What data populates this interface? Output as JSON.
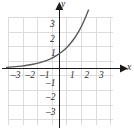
{
  "chart_data": {
    "type": "line",
    "title": "",
    "subtitle": "",
    "xlabel": "x",
    "ylabel": "y",
    "xlim": [
      -3.6,
      3.75
    ],
    "ylim": [
      -3.6,
      3.75
    ],
    "grid": true,
    "grid_step": 1,
    "grid_color": "#d8d8d8",
    "axis_color": "#1a1a1a",
    "curve_color": "#595959",
    "legend": "none",
    "annotations": [],
    "x_ticks": [
      -3,
      -2,
      -1,
      1,
      2,
      3
    ],
    "x_tick_labels": [
      "–3",
      "–2",
      "–1",
      "1",
      "2",
      "3"
    ],
    "y_ticks": [
      -3,
      -2,
      -1,
      1,
      2,
      3
    ],
    "y_tick_labels": [
      "–3",
      "–2",
      "–1",
      "1",
      "2",
      "3"
    ],
    "series": [
      {
        "name": "exponential curve",
        "description": "increasing exponential function passing through (0, 1)",
        "x": [
          -3.6,
          -3.2,
          -2.8,
          -2.4,
          -2.0,
          -1.6,
          -1.2,
          -0.8,
          -0.4,
          0.0,
          0.4,
          0.8,
          1.2,
          1.6,
          2.0,
          2.4,
          2.8,
          3.2,
          3.5
        ],
        "y": [
          0.08,
          0.11,
          0.14,
          0.19,
          0.25,
          0.33,
          0.44,
          0.57,
          0.76,
          1.0,
          1.32,
          1.74,
          2.3,
          3.03,
          4.0,
          5.28,
          6.96,
          9.19,
          11.31
        ]
      }
    ]
  },
  "axis_labels": {
    "x": "x",
    "y": "y"
  },
  "x_tick_text": {
    "neg3": "–3",
    "neg2": "–2",
    "neg1": "–1",
    "pos1": "1",
    "pos2": "2",
    "pos3": "3"
  },
  "y_tick_text": {
    "pos3": "3",
    "pos2": "2",
    "pos1": "1",
    "neg1": "–1",
    "neg2": "–2",
    "neg3": "–3"
  }
}
